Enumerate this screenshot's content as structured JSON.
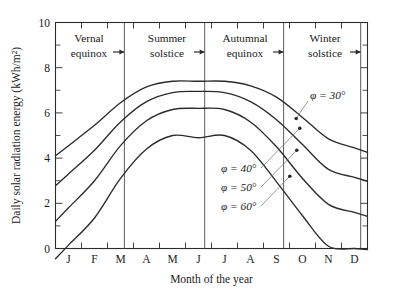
{
  "chart_data": {
    "type": "line",
    "title": "",
    "xlabel": "Month of the year",
    "ylabel": "Daily solar radiation energy (kWh/m²)",
    "xlim": [
      0,
      12
    ],
    "ylim": [
      0,
      10
    ],
    "ytick_labels": [
      "0",
      "2",
      "4",
      "6",
      "8",
      "10"
    ],
    "ytick_values": [
      0,
      2,
      4,
      6,
      8,
      10
    ],
    "yminor_values": [
      1,
      3,
      5,
      7,
      9
    ],
    "xtick_labels": [
      "J",
      "F",
      "M",
      "A",
      "M",
      "J",
      "J",
      "A",
      "S",
      "O",
      "N",
      "D"
    ],
    "grid": false,
    "legend_position": "inline-annotations",
    "x": [
      0.5,
      1.5,
      2.5,
      3.5,
      4.5,
      5.5,
      6.5,
      7.5,
      8.5,
      9.5,
      10.5,
      11.5
    ],
    "series": [
      {
        "name": "φ = 30°",
        "label": "φ = 30°",
        "values": [
          4.55,
          5.45,
          6.45,
          7.15,
          7.4,
          7.4,
          7.4,
          7.2,
          6.7,
          5.8,
          4.85,
          4.45
        ]
      },
      {
        "name": "φ = 40°",
        "label": "φ = 40°",
        "values": [
          3.3,
          4.35,
          5.6,
          6.5,
          6.9,
          6.95,
          6.9,
          6.5,
          5.7,
          4.6,
          3.5,
          3.15
        ]
      },
      {
        "name": "φ = 50°",
        "label": "φ = 50°",
        "values": [
          1.8,
          3.0,
          4.55,
          5.65,
          6.15,
          6.2,
          6.15,
          5.6,
          4.5,
          3.1,
          1.95,
          1.6
        ]
      },
      {
        "name": "φ = 60°",
        "label": "φ = 60°",
        "values": [
          0.15,
          1.35,
          3.1,
          4.4,
          5.0,
          4.9,
          5.0,
          4.35,
          2.95,
          1.45,
          0.1,
          0.0
        ]
      }
    ],
    "annotations": [
      {
        "name": "vernal-equinox",
        "label_line1": "Vernal",
        "label_line2": "equinox",
        "x_value": 2.65
      },
      {
        "name": "summer-solstice",
        "label_line1": "Summer",
        "label_line2": "solstice",
        "x_value": 5.7
      },
      {
        "name": "autumnal-equinox",
        "label_line1": "Autumnal",
        "label_line2": "equinox",
        "x_value": 8.73
      },
      {
        "name": "winter-solstice",
        "label_line1": "Winter",
        "label_line2": "solstice",
        "x_value": 11.72
      }
    ]
  }
}
